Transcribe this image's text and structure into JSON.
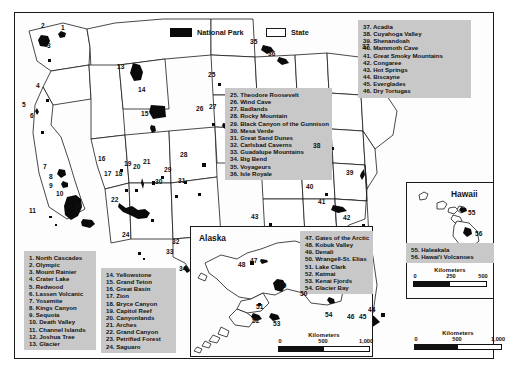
{
  "key": {
    "national_park_label": "National Park",
    "state_label": "State",
    "park_color": "#0a0a0a",
    "state_color": "#ffffff"
  },
  "legends": {
    "west": [
      "1. North Cascades",
      "2. Olympic",
      "3. Mount Rainier",
      "4. Crater Lake",
      "5. Redwood",
      "6. Lassen Volcanic",
      "7. Yosemite",
      "8. Kings Canyon",
      "9. Sequoia",
      "10. Death Valley",
      "11. Channel Islands",
      "12. Joshua Tree",
      "13. Glacier"
    ],
    "southwest": [
      "14. Yellowstone",
      "15. Grand Teton",
      "16. Great Basin",
      "17. Zion",
      "18. Bryce Canyon",
      "19. Capitol Reef",
      "20. Canyonlands",
      "21. Arches",
      "22. Grand Canyon",
      "23. Petrified Forest",
      "24. Saguaro"
    ],
    "central": [
      "25. Theodore Roosevelt",
      "26. Wind Cave",
      "27. Badlands",
      "28. Rocky Mountain",
      "29. Black Canyon of the Gunnison",
      "30. Mesa Verde",
      "31. Great Sand Dunes",
      "32. Carlsbad Caverns",
      "33. Guadalupe Mountains",
      "34. Big Bend",
      "35. Voyageurs",
      "36. Isle Royale"
    ],
    "east": [
      "37. Acadia",
      "38. Cuyahoga Valley",
      "39. Shenandoah",
      "40. Mammoth Cave",
      "41. Great Smoky Mountains",
      "42. Congaree",
      "43. Hot Springs",
      "44. Biscayne",
      "45. Everglades",
      "46. Dry Tortugas"
    ],
    "alaska": [
      "47. Gates of the Arctic",
      "48. Kobuk Valley",
      "49. Denali",
      "50. Wrangell-St. Elias",
      "51. Lake Clark",
      "52. Katmai",
      "53. Kenai Fjords",
      "54. Glacier Bay"
    ],
    "hawaii": [
      "55. Haleakala",
      "56. Hawai'i Volcanoes"
    ]
  },
  "insets": {
    "alaska_title": "Alaska",
    "hawaii_title": "Hawaii"
  },
  "scalebars": {
    "main": {
      "title": "Kilometers",
      "ticks": [
        "0",
        "500",
        "1,000"
      ]
    },
    "alaska": {
      "title": "Kilometers",
      "ticks": [
        "0",
        "500",
        "1,000"
      ]
    },
    "hawaii": {
      "title": "Kilometers",
      "ticks": [
        "0",
        "250",
        "500"
      ]
    }
  },
  "map_labels": {
    "mainland": [
      {
        "n": "1",
        "x": 61,
        "y": 24
      },
      {
        "n": "2",
        "x": 41,
        "y": 22
      },
      {
        "n": "3",
        "x": 47,
        "y": 42
      },
      {
        "n": "4",
        "x": 36,
        "y": 82
      },
      {
        "n": "5",
        "x": 22,
        "y": 101
      },
      {
        "n": "6",
        "x": 30,
        "y": 112
      },
      {
        "n": "7",
        "x": 43,
        "y": 163
      },
      {
        "n": "8",
        "x": 49,
        "y": 173
      },
      {
        "n": "9",
        "x": 49,
        "y": 182
      },
      {
        "n": "10",
        "x": 56,
        "y": 190
      },
      {
        "n": "11",
        "x": 29,
        "y": 207
      },
      {
        "n": "12",
        "x": 74,
        "y": 202
      },
      {
        "n": "13",
        "x": 117,
        "y": 63
      },
      {
        "n": "14",
        "x": 138,
        "y": 86
      },
      {
        "n": "15",
        "x": 141,
        "y": 110
      },
      {
        "n": "16",
        "x": 98,
        "y": 155
      },
      {
        "n": "17",
        "x": 104,
        "y": 170
      },
      {
        "n": "18",
        "x": 115,
        "y": 170
      },
      {
        "n": "19",
        "x": 124,
        "y": 160
      },
      {
        "n": "20",
        "x": 133,
        "y": 163
      },
      {
        "n": "21",
        "x": 143,
        "y": 158
      },
      {
        "n": "22",
        "x": 111,
        "y": 196
      },
      {
        "n": "23",
        "x": 127,
        "y": 206
      },
      {
        "n": "24",
        "x": 122,
        "y": 231
      },
      {
        "n": "25",
        "x": 208,
        "y": 71
      },
      {
        "n": "26",
        "x": 196,
        "y": 105
      },
      {
        "n": "27",
        "x": 209,
        "y": 103
      },
      {
        "n": "28",
        "x": 180,
        "y": 151
      },
      {
        "n": "29",
        "x": 164,
        "y": 166
      },
      {
        "n": "30",
        "x": 155,
        "y": 178
      },
      {
        "n": "31",
        "x": 178,
        "y": 177
      },
      {
        "n": "32",
        "x": 172,
        "y": 238
      },
      {
        "n": "33",
        "x": 166,
        "y": 248
      },
      {
        "n": "34",
        "x": 179,
        "y": 265
      },
      {
        "n": "35",
        "x": 250,
        "y": 38
      },
      {
        "n": "36",
        "x": 268,
        "y": 50
      },
      {
        "n": "37",
        "x": 362,
        "y": 43
      },
      {
        "n": "38",
        "x": 313,
        "y": 142
      },
      {
        "n": "39",
        "x": 346,
        "y": 169
      },
      {
        "n": "40",
        "x": 306,
        "y": 183
      },
      {
        "n": "41",
        "x": 318,
        "y": 198
      },
      {
        "n": "42",
        "x": 343,
        "y": 214
      },
      {
        "n": "43",
        "x": 251,
        "y": 213
      },
      {
        "n": "44",
        "x": 368,
        "y": 306
      },
      {
        "n": "45",
        "x": 359,
        "y": 313
      },
      {
        "n": "46",
        "x": 347,
        "y": 313
      }
    ],
    "alaska": [
      {
        "n": "47",
        "x": 250,
        "y": 257
      },
      {
        "n": "48",
        "x": 238,
        "y": 261
      },
      {
        "n": "49",
        "x": 279,
        "y": 282
      },
      {
        "n": "50",
        "x": 300,
        "y": 290
      },
      {
        "n": "51",
        "x": 256,
        "y": 303
      },
      {
        "n": "52",
        "x": 252,
        "y": 317
      },
      {
        "n": "53",
        "x": 273,
        "y": 320
      },
      {
        "n": "54",
        "x": 325,
        "y": 311
      }
    ],
    "hawaii": [
      {
        "n": "55",
        "x": 468,
        "y": 209
      },
      {
        "n": "56",
        "x": 475,
        "y": 230
      }
    ]
  }
}
